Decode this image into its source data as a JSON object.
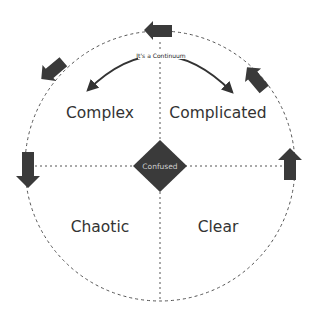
{
  "diagram": {
    "center_label": "Confused",
    "continuum_label": "It's a Continuum",
    "domains": [
      {
        "name": "Complex",
        "position": "top-left"
      },
      {
        "name": "Complicated",
        "position": "top-right"
      },
      {
        "name": "Chaotic",
        "position": "bottom-left"
      },
      {
        "name": "Clear",
        "position": "bottom-right"
      }
    ],
    "arrows": [
      {
        "position": "top",
        "direction": "left"
      },
      {
        "position": "upper-left",
        "direction": "down-left"
      },
      {
        "position": "upper-right",
        "direction": "up-left"
      },
      {
        "position": "left",
        "direction": "down"
      },
      {
        "position": "right",
        "direction": "up"
      }
    ],
    "colors": {
      "shape_fill": "#3a3a3a",
      "line": "#444444",
      "text": "#333333",
      "background": "#ffffff"
    }
  }
}
